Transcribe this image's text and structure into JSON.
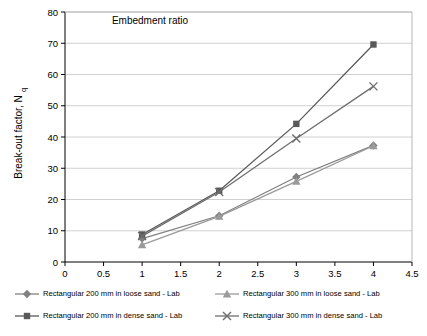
{
  "chart_data": {
    "type": "line",
    "title": "",
    "xlabel": "Embedment ratio",
    "ylabel": "Break-out factor, Nq",
    "xlim": [
      0,
      4.5
    ],
    "ylim": [
      0,
      80
    ],
    "xticks": [
      "0",
      "0.5",
      "1",
      "1.5",
      "2",
      "2.5",
      "3",
      "3.5",
      "4",
      "4.5"
    ],
    "yticks": [
      "0",
      "10",
      "20",
      "30",
      "40",
      "50",
      "60",
      "70",
      "80"
    ],
    "grid": "horizontal",
    "legend_position": "bottom",
    "x": [
      1,
      2,
      3,
      4
    ],
    "series": [
      {
        "name": "Rectangular 200 mm in loose sand - Lab",
        "marker": "diamond",
        "color": "#808080",
        "values": [
          7.5,
          14.8,
          27.2,
          37.3
        ]
      },
      {
        "name": "Rectangular 300 mm in loose sand - Lab",
        "marker": "triangle",
        "color": "#9a9a9a",
        "values": [
          5.5,
          14.6,
          25.8,
          37.2
        ]
      },
      {
        "name": "Rectangular 200 mm in dense sand - Lab",
        "marker": "square",
        "color": "#595959",
        "values": [
          8.8,
          22.8,
          44.2,
          69.6
        ]
      },
      {
        "name": "Rectangular 300 mm in dense sand - Lab",
        "marker": "cross",
        "color": "#6e6e6e",
        "values": [
          8.3,
          22.4,
          39.5,
          56.2
        ]
      }
    ]
  }
}
